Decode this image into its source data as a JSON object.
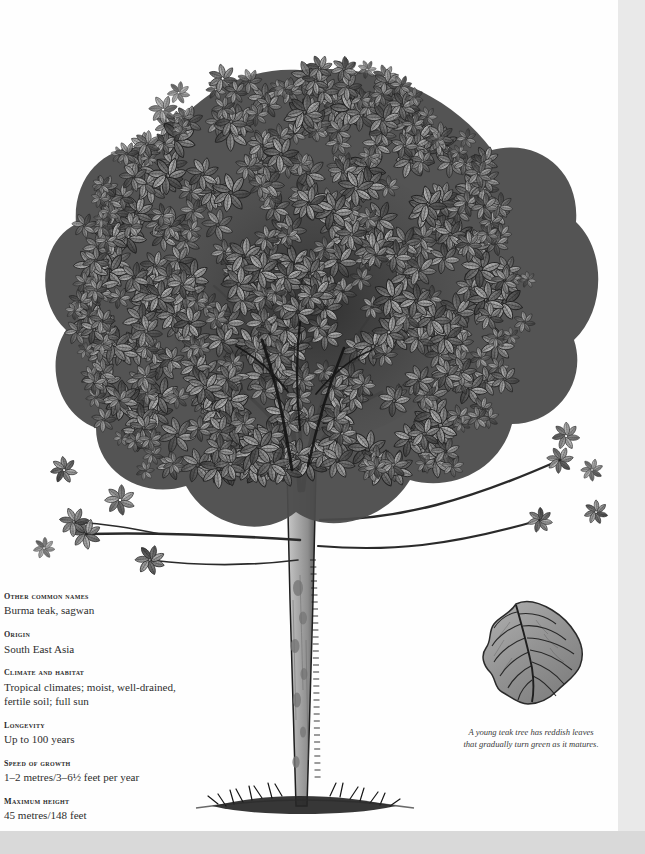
{
  "page": {
    "background_color": "#fefefe",
    "gutter_color": "#e9e9e9",
    "bottom_band_color": "#d9d9d9"
  },
  "illustration": {
    "subject": "teak-tree",
    "style": "greyscale ink and wash botanical illustration",
    "name": "teak-tree-illustration"
  },
  "facts": [
    {
      "label": "Other common names",
      "value": "Burma teak, sagwan"
    },
    {
      "label": "Origin",
      "value": "South East Asia"
    },
    {
      "label": "Climate and habitat",
      "value": "Tropical climates; moist, well-drained, fertile soil; full sun"
    },
    {
      "label": "Longevity",
      "value": "Up to 100 years"
    },
    {
      "label": "Speed of growth",
      "value": "1–2 metres/3–6½ feet per year"
    },
    {
      "label": "Maximum height",
      "value": "45 metres/148 feet"
    }
  ],
  "leaf_detail": {
    "name": "teak-leaf-detail",
    "caption_line1": "A young teak tree has reddish leaves",
    "caption_line2": "that gradually turn green as it matures."
  },
  "colors": {
    "ink": "#1c1c1c",
    "leaf_mid": "#8a8a8a",
    "leaf_dark": "#555555",
    "leaf_light": "#a8a8a8",
    "trunk": "#9c9c9c",
    "text": "#2e2e2e"
  }
}
